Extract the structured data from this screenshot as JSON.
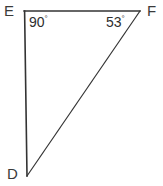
{
  "figure": {
    "type": "geometry-diagram",
    "shape": "right-triangle",
    "background_color": "#ffffff",
    "stroke_color": "#333333",
    "vertices": [
      {
        "name": "E",
        "label": "E",
        "x": 24,
        "y": 11,
        "label_x": 4,
        "label_y": 3
      },
      {
        "name": "F",
        "label": "F",
        "x": 140,
        "y": 11,
        "label_x": 147,
        "label_y": 3
      },
      {
        "name": "D",
        "label": "D",
        "x": 27,
        "y": 176,
        "label_x": 7,
        "label_y": 166
      }
    ],
    "sides": [
      {
        "name": "EF",
        "from": "E",
        "to": "F"
      },
      {
        "name": "ED",
        "from": "E",
        "to": "D"
      },
      {
        "name": "DF",
        "from": "D",
        "to": "F"
      }
    ],
    "angles": [
      {
        "at": "E",
        "value": "90",
        "degree_symbol": "°",
        "label_x": 29,
        "label_y": 15
      },
      {
        "at": "F",
        "value": "53",
        "degree_symbol": "°",
        "label_x": 106,
        "label_y": 15
      }
    ]
  },
  "labels": {
    "vertex_E": "E",
    "vertex_F": "F",
    "vertex_D": "D",
    "angle_E_value": "90",
    "angle_F_value": "53",
    "degree": "°"
  }
}
